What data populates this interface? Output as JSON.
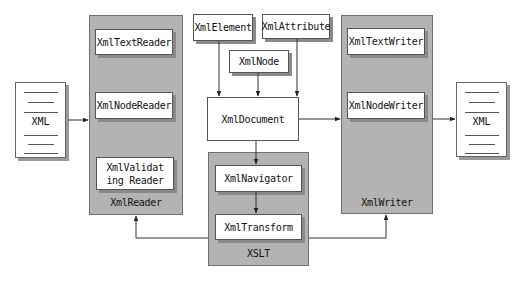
{
  "source_doc": {
    "label": "XML"
  },
  "target_doc": {
    "label": "XML"
  },
  "reader_group": {
    "label": "XmlReader",
    "items": [
      {
        "label": "XmlTextReader"
      },
      {
        "label": "XmlNodeReader"
      },
      {
        "label": "XmlValidating Reader"
      }
    ]
  },
  "dom_classes": {
    "element": "XmlElement",
    "attribute": "XmlAttribute",
    "node": "XmlNode",
    "document": "XmlDocument"
  },
  "xslt_group": {
    "label": "XSLT",
    "items": [
      {
        "label": "XmlNavigator"
      },
      {
        "label": "XmlTransform"
      }
    ]
  },
  "writer_group": {
    "label": "XmlWriter",
    "items": [
      {
        "label": "XmlTextWriter"
      },
      {
        "label": "XmlNodeWriter"
      }
    ]
  },
  "colors": {
    "panel_fill": "#b3b3b3",
    "box_fill": "#ffffff",
    "line": "#333333"
  }
}
